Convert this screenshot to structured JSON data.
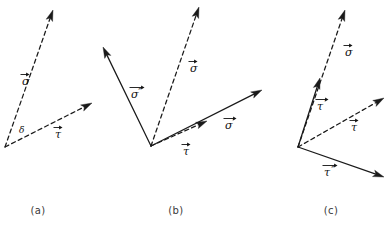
{
  "figure": {
    "background_color": "#ffffff",
    "stroke_color": "#1a1a1a",
    "width": 392,
    "height": 226
  },
  "panels": [
    {
      "id": "a",
      "caption": "(a)",
      "caption_x": 38,
      "caption_y": 214,
      "origin": {
        "x": 5,
        "y": 147
      },
      "angle_label": {
        "text": "δ",
        "x": 19,
        "y": 133
      },
      "vectors": [
        {
          "name": "sigma",
          "label": "σ",
          "prime": "",
          "style": "dashed",
          "tip": {
            "x": 53,
            "y": 10
          },
          "label_x": 22,
          "label_y": 85
        },
        {
          "name": "tau",
          "label": "τ",
          "prime": "",
          "style": "dashed",
          "tip": {
            "x": 92,
            "y": 103
          },
          "label_x": 55,
          "label_y": 138
        }
      ]
    },
    {
      "id": "b",
      "caption": "(b)",
      "caption_x": 176,
      "caption_y": 214,
      "origin": {
        "x": 151,
        "y": 146
      },
      "angle_label": null,
      "vectors": [
        {
          "name": "sigma-double-prime",
          "label": "σ",
          "prime": "″",
          "style": "solid",
          "tip": {
            "x": 103,
            "y": 47
          },
          "label_x": 131,
          "label_y": 98
        },
        {
          "name": "sigma",
          "label": "σ",
          "prime": "",
          "style": "dashed",
          "tip": {
            "x": 199,
            "y": 7
          },
          "label_x": 190,
          "label_y": 72
        },
        {
          "name": "tau",
          "label": "τ",
          "prime": "",
          "style": "dashed",
          "tip": {
            "x": 207,
            "y": 121
          },
          "label_x": 183,
          "label_y": 155
        },
        {
          "name": "sigma-prime",
          "label": "σ",
          "prime": "′",
          "style": "solid",
          "tip": {
            "x": 262,
            "y": 90
          },
          "label_x": 225,
          "label_y": 129
        }
      ]
    },
    {
      "id": "c",
      "caption": "(c)",
      "caption_x": 331,
      "caption_y": 214,
      "origin": {
        "x": 298,
        "y": 147
      },
      "angle_label": null,
      "vectors": [
        {
          "name": "sigma",
          "label": "σ",
          "prime": "",
          "style": "dashed",
          "tip": {
            "x": 345,
            "y": 10
          },
          "label_x": 345,
          "label_y": 56
        },
        {
          "name": "tau-prime",
          "label": "τ",
          "prime": "′",
          "style": "solid",
          "tip": {
            "x": 320,
            "y": 78
          },
          "label_x": 317,
          "label_y": 110
        },
        {
          "name": "tau",
          "label": "τ",
          "prime": "",
          "style": "dashed",
          "tip": {
            "x": 384,
            "y": 98
          },
          "label_x": 351,
          "label_y": 131
        },
        {
          "name": "tau-double-prime",
          "label": "τ",
          "prime": "″",
          "style": "solid",
          "tip": {
            "x": 384,
            "y": 177
          },
          "label_x": 324,
          "label_y": 176
        }
      ]
    }
  ]
}
